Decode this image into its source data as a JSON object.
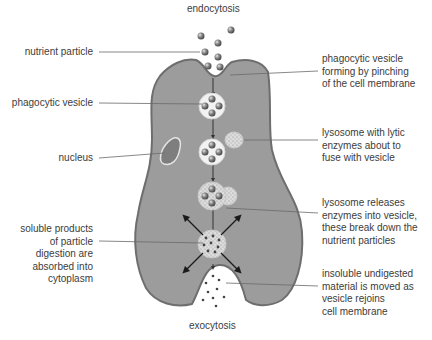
{
  "title_top": "endocytosis",
  "title_bottom": "exocytosis",
  "colors": {
    "cytoplasm": "#9b9b9b",
    "membrane": "#7a7a7a",
    "vesicle": "#f2f2f2",
    "particle": "#6f6f6f",
    "leader_line": "#6a6a6a"
  },
  "left_labels": [
    {
      "id": "nutrient-particle",
      "lines": [
        "nutrient particle"
      ]
    },
    {
      "id": "phagocytic-vesicle",
      "lines": [
        "phagocytic vesicle"
      ]
    },
    {
      "id": "nucleus",
      "lines": [
        "nucleus"
      ]
    },
    {
      "id": "soluble-products",
      "lines": [
        "soluble products",
        "of particle",
        "digestion are",
        "absorbed into",
        "cytoplasm"
      ]
    }
  ],
  "right_labels": [
    {
      "id": "vesicle-forming",
      "lines": [
        "phagocytic vesicle",
        "forming by pinching",
        "of the cell membrane"
      ]
    },
    {
      "id": "lysosome-lytic",
      "lines": [
        "lysosome with lytic",
        "enzymes about to",
        "fuse with vesicle"
      ]
    },
    {
      "id": "lysosome-releases",
      "lines": [
        "lysosome releases",
        "enzymes into vesicle,",
        "these break down the",
        "nutrient particles"
      ]
    },
    {
      "id": "insoluble-material",
      "lines": [
        "insoluble undigested",
        "material is moved as",
        "vesicle rejoins",
        "cell membrane"
      ]
    }
  ]
}
